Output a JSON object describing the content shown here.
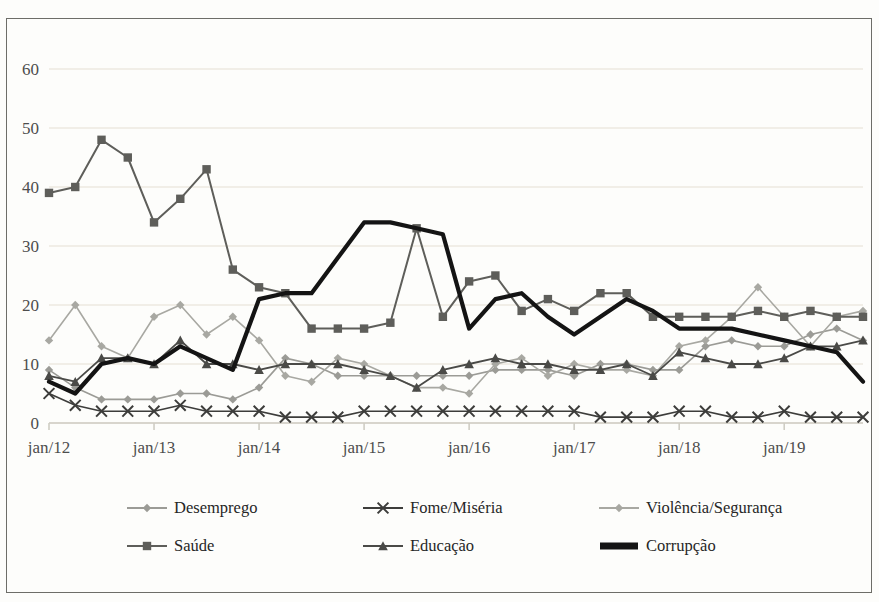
{
  "title": "",
  "chart_data": {
    "type": "line",
    "title": "",
    "xlabel": "",
    "ylabel": "",
    "ylim": [
      0,
      60
    ],
    "yticks": [
      0,
      10,
      20,
      30,
      40,
      50,
      60
    ],
    "grid": true,
    "legend_position": "bottom",
    "xtick_labels": [
      "jan/12",
      "jan/13",
      "jan/14",
      "jan/15",
      "jan/16",
      "jan/17",
      "jan/18",
      "jan/19"
    ],
    "x_index": [
      0,
      1,
      2,
      3,
      4,
      5,
      6,
      7,
      8,
      9,
      10,
      11,
      12,
      13,
      14,
      15,
      16,
      17,
      18,
      19,
      20,
      21,
      22,
      23,
      24,
      25,
      26,
      27,
      28,
      29,
      30,
      31
    ],
    "x_tick_index": [
      0,
      4,
      8,
      12,
      16,
      20,
      24,
      28
    ],
    "series": [
      {
        "name": "Desemprego",
        "color": "#9b9b96",
        "marker": "diamond",
        "width": 1.6,
        "values": [
          9,
          6,
          4,
          4,
          4,
          5,
          5,
          4,
          6,
          11,
          10,
          8,
          8,
          8,
          8,
          8,
          8,
          9,
          9,
          9,
          8,
          10,
          10,
          9,
          9,
          13,
          14,
          13,
          13,
          15,
          16,
          14
        ]
      },
      {
        "name": "Fome/Miséria",
        "color": "#3d3d3b",
        "marker": "x",
        "width": 1.6,
        "values": [
          5,
          3,
          2,
          2,
          2,
          3,
          2,
          2,
          2,
          1,
          1,
          1,
          2,
          2,
          2,
          2,
          2,
          2,
          2,
          2,
          2,
          1,
          1,
          1,
          2,
          2,
          1,
          1,
          2,
          1,
          1,
          1
        ]
      },
      {
        "name": "Violência/Segurança",
        "color": "#a8a8a2",
        "marker": "diamond",
        "width": 1.6,
        "values": [
          14,
          20,
          13,
          11,
          18,
          20,
          15,
          18,
          14,
          8,
          7,
          11,
          10,
          8,
          6,
          6,
          5,
          10,
          11,
          8,
          10,
          9,
          9,
          8,
          13,
          14,
          18,
          23,
          18,
          13,
          18,
          19
        ]
      },
      {
        "name": "Saúde",
        "color": "#5e5e5a",
        "marker": "square",
        "width": 2.0,
        "values": [
          39,
          40,
          48,
          45,
          34,
          38,
          43,
          26,
          23,
          22,
          16,
          16,
          16,
          17,
          33,
          18,
          24,
          25,
          19,
          21,
          19,
          22,
          22,
          18,
          18,
          18,
          18,
          19,
          18,
          19,
          18,
          18
        ]
      },
      {
        "name": "Educação",
        "color": "#4a4a47",
        "marker": "triangle",
        "width": 1.8,
        "values": [
          8,
          7,
          11,
          11,
          10,
          14,
          10,
          10,
          9,
          10,
          10,
          10,
          9,
          8,
          6,
          9,
          10,
          11,
          10,
          10,
          9,
          9,
          10,
          8,
          12,
          11,
          10,
          10,
          11,
          13,
          13,
          14
        ]
      },
      {
        "name": "Corrupção",
        "color": "#141414",
        "marker": "none",
        "width": 4.2,
        "values": [
          7,
          5,
          10,
          11,
          10,
          13,
          11,
          9,
          21,
          22,
          22,
          28,
          34,
          34,
          33,
          32,
          16,
          21,
          22,
          18,
          15,
          18,
          21,
          19,
          16,
          16,
          16,
          15,
          14,
          13,
          12,
          7
        ]
      }
    ]
  },
  "legend": {
    "row1": [
      "Desemprego",
      "Fome/Miséria",
      "Violência/Segurança"
    ],
    "row2": [
      "Saúde",
      "Educação",
      "Corrupção"
    ]
  },
  "axis": {
    "y_labels": [
      "60",
      "50",
      "40",
      "30",
      "20",
      "10",
      "0"
    ],
    "x_labels": [
      "jan/12",
      "jan/13",
      "jan/14",
      "jan/15",
      "jan/16",
      "jan/17",
      "jan/18",
      "jan/19"
    ]
  },
  "colors": {
    "frame": "#6d6d68",
    "gridline": "#ece9e0",
    "axis_text": "#4d4d4d",
    "background": "#fdfdfb"
  }
}
